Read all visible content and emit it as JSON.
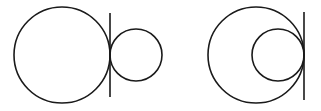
{
  "diagram": {
    "stroke_color": "#1a1a1a",
    "background": "#ffffff",
    "figures": [
      {
        "name": "external-tangency",
        "large_circle": {
          "cx": 62,
          "cy": 55,
          "r": 48
        },
        "small_circle": {
          "cx": 136,
          "cy": 55,
          "r": 26
        },
        "tangent_line": {
          "x": 110,
          "y1": 13,
          "y2": 97
        }
      },
      {
        "name": "internal-tangency",
        "large_circle": {
          "cx": 256,
          "cy": 55,
          "r": 48
        },
        "small_circle": {
          "cx": 278,
          "cy": 55,
          "r": 26
        },
        "tangent_line": {
          "x": 304,
          "y1": 12,
          "y2": 100
        }
      }
    ]
  }
}
